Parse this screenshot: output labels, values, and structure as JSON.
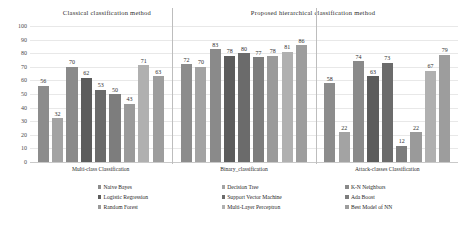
{
  "panels": {
    "left_title": "Classical classification method",
    "right_title": "Proposed hierarchical classification method"
  },
  "chart_data": {
    "type": "bar",
    "subtitle": "",
    "xlabel": "",
    "ylabel": "",
    "ylim": [
      0,
      100
    ],
    "yticks": [
      0,
      10,
      20,
      30,
      40,
      50,
      60,
      70,
      80,
      90,
      100
    ],
    "grid": true,
    "legend_position": "bottom",
    "categories": [
      "Multi-class Classification",
      "Binary_classification",
      "Attack-classes Classification"
    ],
    "series": [
      {
        "name": "Naive Bayes",
        "color": "#8c8c8c",
        "values": [
          56,
          72,
          58
        ]
      },
      {
        "name": "Decision Tree",
        "color": "#a3a3a3",
        "values": [
          32,
          70,
          22
        ]
      },
      {
        "name": "K-N Neighbors",
        "color": "#8a8a8a",
        "values": [
          70,
          83,
          74
        ]
      },
      {
        "name": "Logistic Regression",
        "color": "#5c5c5c",
        "values": [
          62,
          78,
          63
        ]
      },
      {
        "name": "Support Vector Machine",
        "color": "#6b6b6b",
        "values": [
          53,
          80,
          73
        ]
      },
      {
        "name": "Ada Boost",
        "color": "#7d7d7d",
        "values": [
          50,
          77,
          12
        ]
      },
      {
        "name": "Random Forest",
        "color": "#9a9a9a",
        "values": [
          43,
          78,
          22
        ]
      },
      {
        "name": "Multi-Layer Perceptron",
        "color": "#b0b0b0",
        "values": [
          71,
          81,
          67
        ]
      },
      {
        "name": "Best Model of NN",
        "color": "#9d9d9d",
        "values": [
          63,
          86,
          79
        ]
      }
    ]
  }
}
